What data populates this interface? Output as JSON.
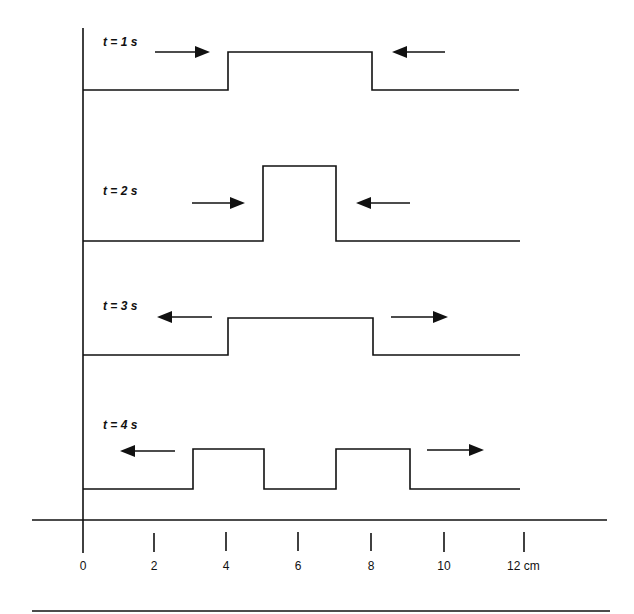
{
  "diagram": {
    "panels": [
      {
        "label": "t = 1 s",
        "profile_cm": [
          [
            0,
            0
          ],
          [
            4,
            0
          ],
          [
            4,
            1
          ],
          [
            8,
            1
          ],
          [
            8,
            0
          ],
          [
            12,
            0
          ]
        ],
        "arrows": [
          {
            "from_cm": 1.3,
            "to_cm": 3.9,
            "direction": "right"
          },
          {
            "from_cm": 10.0,
            "to_cm": 8.4,
            "direction": "left"
          }
        ]
      },
      {
        "label": "t = 2 s",
        "profile_cm": [
          [
            0,
            0
          ],
          [
            5,
            0
          ],
          [
            5,
            2
          ],
          [
            7,
            2
          ],
          [
            7,
            0
          ],
          [
            12,
            0
          ]
        ],
        "arrows": [
          {
            "from_cm": 3.0,
            "to_cm": 4.5,
            "direction": "right"
          },
          {
            "from_cm": 9.0,
            "to_cm": 7.5,
            "direction": "left"
          }
        ]
      },
      {
        "label": "t = 3 s",
        "profile_cm": [
          [
            0,
            0
          ],
          [
            4,
            0
          ],
          [
            4,
            1
          ],
          [
            8,
            1
          ],
          [
            8,
            0
          ],
          [
            12,
            0
          ]
        ],
        "arrows": [
          {
            "from_cm": 3.5,
            "to_cm": 2.0,
            "direction": "left"
          },
          {
            "from_cm": 8.5,
            "to_cm": 10.0,
            "direction": "right"
          }
        ]
      },
      {
        "label": "t = 4 s",
        "profile_cm": [
          [
            0,
            0
          ],
          [
            3,
            0
          ],
          [
            3,
            1
          ],
          [
            5,
            1
          ],
          [
            5,
            0
          ],
          [
            7,
            0
          ],
          [
            7,
            1
          ],
          [
            9,
            1
          ],
          [
            9,
            0
          ],
          [
            12,
            0
          ]
        ],
        "arrows": [
          {
            "from_cm": 2.5,
            "to_cm": 1.0,
            "direction": "left"
          },
          {
            "from_cm": 9.5,
            "to_cm": 11.0,
            "direction": "right"
          }
        ]
      }
    ],
    "x_axis": {
      "ticks": [
        "0",
        "2",
        "4",
        "6",
        "8",
        "10",
        "12 cm"
      ],
      "unit": "cm"
    },
    "colors": {
      "line": "#111111",
      "background": "#ffffff"
    }
  }
}
